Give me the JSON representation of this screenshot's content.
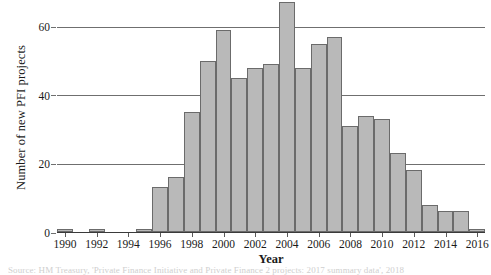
{
  "chart_data": {
    "type": "bar",
    "title": "",
    "xlabel": "Year",
    "ylabel": "Number of new PFI projects",
    "ylim": [
      0,
      68
    ],
    "yticks": [
      0,
      20,
      40,
      60
    ],
    "grid": "horizontal",
    "legend": "none",
    "bar_color": "#b9b9b9",
    "bar_edge_color": "#6b6b6b",
    "categories": [
      "1990",
      "1991",
      "1992",
      "1993",
      "1994",
      "1995",
      "1996",
      "1997",
      "1998",
      "1999",
      "2000",
      "2001",
      "2002",
      "2003",
      "2004",
      "2005",
      "2006",
      "2007",
      "2008",
      "2009",
      "2010",
      "2011",
      "2012",
      "2013",
      "2014",
      "2015",
      "2016"
    ],
    "values": [
      1,
      0,
      1,
      0,
      0,
      1,
      13,
      16,
      35,
      50,
      59,
      45,
      48,
      49,
      67,
      48,
      55,
      57,
      31,
      34,
      33,
      23,
      18,
      8,
      6,
      6,
      1
    ],
    "xtick_labels": [
      "1990",
      "",
      "1992",
      "",
      "1994",
      "",
      "1996",
      "",
      "1998",
      "",
      "2000",
      "",
      "2002",
      "",
      "2004",
      "",
      "2006",
      "",
      "2008",
      "",
      "2010",
      "",
      "2012",
      "",
      "2014",
      "",
      "2016"
    ]
  },
  "source_note": "Source: HM Treasury, 'Private Finance Initiative and Private Finance 2 projects: 2017 summary data', 2018"
}
